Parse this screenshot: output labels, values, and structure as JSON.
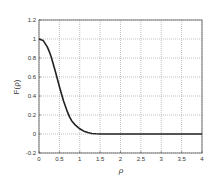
{
  "chart_data": {
    "type": "line",
    "title": "",
    "xlabel": "ρ",
    "ylabel": "F(ρ)",
    "xlim": [
      0,
      4
    ],
    "ylim": [
      -0.2,
      1.2
    ],
    "xticks": [
      0,
      0.5,
      1,
      1.5,
      2,
      2.5,
      3,
      3.5,
      4
    ],
    "xtick_labels": [
      "0",
      "0.5",
      "1",
      "1.5",
      "2",
      "2.5",
      "3",
      "3.5",
      "4"
    ],
    "yticks": [
      -0.2,
      0,
      0.2,
      0.4,
      0.6,
      0.8,
      1,
      1.2
    ],
    "ytick_labels": [
      "-0.2",
      "0",
      "0.2",
      "0.4",
      "0.6",
      "0.8",
      "1",
      "1.2"
    ],
    "grid": true,
    "legend": null,
    "series": [
      {
        "name": "F(ρ)",
        "color": "#222222",
        "x": [
          0,
          0.1,
          0.2,
          0.25,
          0.3,
          0.4,
          0.5,
          0.6,
          0.7,
          0.75,
          0.8,
          0.9,
          1.0,
          1.1,
          1.2,
          1.25,
          1.3,
          1.4,
          1.5,
          2.0,
          2.5,
          3.0,
          3.5,
          4.0
        ],
        "y": [
          1.0,
          0.985,
          0.92,
          0.87,
          0.81,
          0.66,
          0.5,
          0.35,
          0.23,
          0.18,
          0.14,
          0.09,
          0.055,
          0.03,
          0.015,
          0.01,
          0.006,
          0.002,
          0.0,
          0.0,
          0.0,
          0.0,
          0.0,
          0.0
        ]
      }
    ]
  }
}
